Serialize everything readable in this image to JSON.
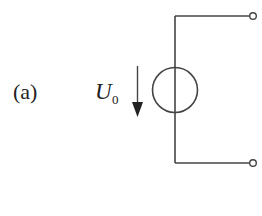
{
  "figure": {
    "label": "(a)",
    "voltage_symbol": "U",
    "voltage_subscript": "0",
    "stroke_color": "#444444"
  }
}
